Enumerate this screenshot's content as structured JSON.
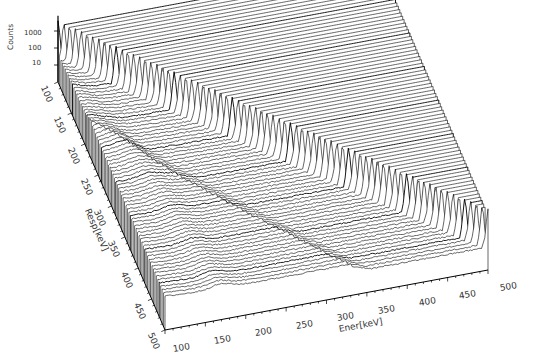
{
  "chart_data": {
    "type": "waterfall-3d",
    "title": "",
    "xlabel": "Ener[keV]",
    "ylabel": "Resp[keV]",
    "zlabel": "Counts",
    "x_ticks": [
      "100",
      "150",
      "200",
      "250",
      "300",
      "350",
      "400",
      "450",
      "500"
    ],
    "y_ticks": [
      "100",
      "150",
      "200",
      "250",
      "300",
      "350",
      "400",
      "450",
      "500"
    ],
    "z_ticks": [
      "10",
      "100",
      "1000"
    ],
    "xlim": [
      100,
      500
    ],
    "ylim": [
      100,
      500
    ],
    "zscale": "log",
    "grid": false,
    "legend": null,
    "series_description": "One gamma-ray response spectrum per Resp energy (100-500 keV, ~75 traces); each shows a full-energy peak at Ener = Resp (~1000+ counts), a Compton continuum, and a Compton edge ridge; spectra are cut off above the full-energy peak.",
    "features": [
      {
        "name": "full-energy peak ridge",
        "relation": "Ener = Resp",
        "height_counts": 1000
      },
      {
        "name": "Compton edge ridge",
        "relation": "Ener = 2*Resp^2/(511+2*Resp)"
      },
      {
        "name": "backscatter ridge",
        "approx_ener_keV": [
          150,
          200
        ]
      }
    ]
  },
  "axes": {
    "z_label": "Counts",
    "z_ticks": [
      {
        "label": "1000"
      },
      {
        "label": "100"
      },
      {
        "label": "10"
      }
    ],
    "y_label": "Resp[keV]",
    "y_ticks": [
      "100",
      "150",
      "200",
      "250",
      "300",
      "350",
      "400",
      "450",
      "500"
    ],
    "x_label": "Ener[keV]",
    "x_ticks": [
      "100",
      "150",
      "200",
      "250",
      "300",
      "350",
      "400",
      "450",
      "500"
    ]
  },
  "geometry": {
    "origin": [
      58,
      82
    ],
    "x_vec_per_keV": [
      0.8075,
      -0.15
    ],
    "y_vec_per_keV": [
      0.2675,
      0.62
    ],
    "z_px_per_decade": 17,
    "traces": 75,
    "line_color": "#000000",
    "bg_color": "#ffffff"
  }
}
